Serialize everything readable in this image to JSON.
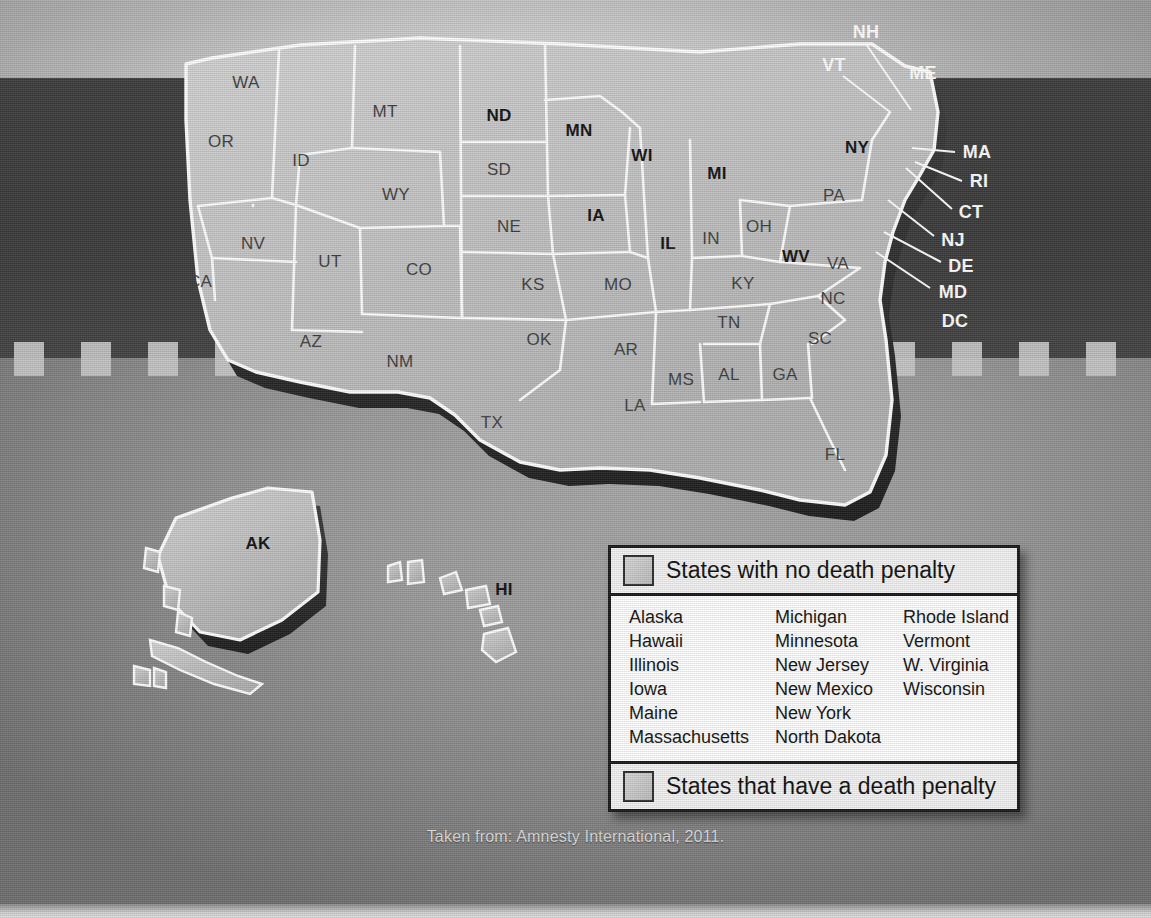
{
  "caption": "Taken from: Amnesty International, 2011.",
  "colors": {
    "no_penalty_label": "#111111",
    "penalty_label": "#3e3e3e",
    "callout_label": "#ffffff",
    "land_fill": "#c2c2c2",
    "border": "#ffffff",
    "extrude_shadow": "#2a2a2a",
    "dark_band": "#3a3a3a",
    "legend_border": "#16181a",
    "legend_bg": "#ffffff"
  },
  "legend": {
    "header_label": "States with no death penalty",
    "footer_label": "States that have a death penalty",
    "header_swatch": "swatch-light-gray",
    "footer_swatch": "swatch-light-gray",
    "columns": [
      [
        "Alaska",
        "Hawaii",
        "Illinois",
        "Iowa",
        "Maine",
        "Massachusetts"
      ],
      [
        "Michigan",
        "Minnesota",
        "New Jersey",
        "New Mexico",
        "New York",
        "North Dakota"
      ],
      [
        "Rhode Island",
        "Vermont",
        "W. Virginia",
        "Wisconsin"
      ]
    ]
  },
  "map": {
    "state_labels": [
      {
        "code": "WA",
        "x": 246,
        "y": 82,
        "style": "dark"
      },
      {
        "code": "OR",
        "x": 221,
        "y": 141,
        "style": "dark"
      },
      {
        "code": "ID",
        "x": 301,
        "y": 160,
        "style": "dark"
      },
      {
        "code": "MT",
        "x": 385,
        "y": 111,
        "style": "dark"
      },
      {
        "code": "WY",
        "x": 396,
        "y": 194,
        "style": "dark"
      },
      {
        "code": "NV",
        "x": 253,
        "y": 243,
        "style": "dark"
      },
      {
        "code": "CA",
        "x": 200,
        "y": 281,
        "style": "dark"
      },
      {
        "code": "UT",
        "x": 330,
        "y": 261,
        "style": "dark"
      },
      {
        "code": "CO",
        "x": 419,
        "y": 269,
        "style": "dark"
      },
      {
        "code": "AZ",
        "x": 311,
        "y": 341,
        "style": "dark"
      },
      {
        "code": "NM",
        "x": 400,
        "y": 361,
        "style": "dark"
      },
      {
        "code": "ND",
        "x": 499,
        "y": 115,
        "style": "bold"
      },
      {
        "code": "SD",
        "x": 499,
        "y": 169,
        "style": "dark"
      },
      {
        "code": "NE",
        "x": 509,
        "y": 226,
        "style": "dark"
      },
      {
        "code": "KS",
        "x": 533,
        "y": 284,
        "style": "dark"
      },
      {
        "code": "OK",
        "x": 539,
        "y": 339,
        "style": "dark"
      },
      {
        "code": "TX",
        "x": 492,
        "y": 422,
        "style": "dark"
      },
      {
        "code": "MN",
        "x": 579,
        "y": 130,
        "style": "bold"
      },
      {
        "code": "IA",
        "x": 596,
        "y": 215,
        "style": "bold"
      },
      {
        "code": "MO",
        "x": 618,
        "y": 284,
        "style": "dark"
      },
      {
        "code": "AR",
        "x": 626,
        "y": 349,
        "style": "dark"
      },
      {
        "code": "LA",
        "x": 635,
        "y": 405,
        "style": "dark"
      },
      {
        "code": "WI",
        "x": 642,
        "y": 155,
        "style": "bold"
      },
      {
        "code": "IL",
        "x": 668,
        "y": 243,
        "style": "bold"
      },
      {
        "code": "MI",
        "x": 717,
        "y": 173,
        "style": "bold"
      },
      {
        "code": "IN",
        "x": 711,
        "y": 238,
        "style": "dark"
      },
      {
        "code": "OH",
        "x": 759,
        "y": 226,
        "style": "dark"
      },
      {
        "code": "KY",
        "x": 743,
        "y": 283,
        "style": "dark"
      },
      {
        "code": "TN",
        "x": 729,
        "y": 322,
        "style": "dark"
      },
      {
        "code": "MS",
        "x": 681,
        "y": 379,
        "style": "dark"
      },
      {
        "code": "AL",
        "x": 729,
        "y": 374,
        "style": "dark"
      },
      {
        "code": "GA",
        "x": 785,
        "y": 374,
        "style": "dark"
      },
      {
        "code": "FL",
        "x": 835,
        "y": 454,
        "style": "dark"
      },
      {
        "code": "SC",
        "x": 820,
        "y": 338,
        "style": "dark"
      },
      {
        "code": "NC",
        "x": 833,
        "y": 298,
        "style": "dark"
      },
      {
        "code": "VA",
        "x": 838,
        "y": 263,
        "style": "dark"
      },
      {
        "code": "WV",
        "x": 796,
        "y": 256,
        "style": "bold"
      },
      {
        "code": "PA",
        "x": 834,
        "y": 195,
        "style": "dark"
      },
      {
        "code": "NY",
        "x": 857,
        "y": 147,
        "style": "bold"
      },
      {
        "code": "AK",
        "x": 258,
        "y": 543,
        "style": "bold"
      },
      {
        "code": "HI",
        "x": 504,
        "y": 589,
        "style": "bold"
      }
    ],
    "callout_labels": [
      {
        "code": "NH",
        "x": 866,
        "y": 32,
        "line": [
          866,
          44,
          911,
          110
        ]
      },
      {
        "code": "VT",
        "x": 834,
        "y": 65,
        "line": [
          843,
          76,
          890,
          112
        ]
      },
      {
        "code": "ME",
        "x": 923,
        "y": 73,
        "line": null
      },
      {
        "code": "MA",
        "x": 977,
        "y": 152,
        "line": [
          955,
          152,
          912,
          148
        ]
      },
      {
        "code": "RI",
        "x": 979,
        "y": 181,
        "line": [
          962,
          181,
          915,
          162
        ]
      },
      {
        "code": "CT",
        "x": 971,
        "y": 212,
        "line": [
          952,
          209,
          906,
          168
        ]
      },
      {
        "code": "NJ",
        "x": 953,
        "y": 240,
        "line": [
          934,
          236,
          888,
          200
        ]
      },
      {
        "code": "DE",
        "x": 961,
        "y": 266,
        "line": [
          941,
          262,
          884,
          232
        ]
      },
      {
        "code": "MD",
        "x": 953,
        "y": 292,
        "line": [
          930,
          288,
          876,
          252
        ]
      },
      {
        "code": "DC",
        "x": 955,
        "y": 321,
        "line": null
      }
    ]
  },
  "background": {
    "dash_count": 17,
    "dash_start_x": 14,
    "dash_pitch": 67,
    "dash_color": "#c9c9c9"
  }
}
